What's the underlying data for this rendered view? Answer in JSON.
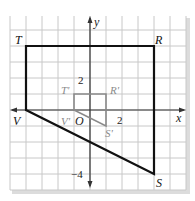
{
  "colors": {
    "background": "#ffffff",
    "grid_fill": "#ffffff",
    "grid_line": "#c8c8c8",
    "axis": "#333333",
    "preimage": "#111111",
    "image": "#8a8a8a",
    "shadow": "#dcdcdc"
  },
  "axes": {
    "x_label": "x",
    "y_label": "y",
    "origin_label": "O",
    "tick_labels": {
      "x_pos_2": "2",
      "y_pos_2": "2",
      "y_neg_4": "−4"
    }
  },
  "preimage": {
    "name": "TRSV",
    "vertices": [
      {
        "label": "T",
        "x": -4,
        "y": 4
      },
      {
        "label": "R",
        "x": 4,
        "y": 4
      },
      {
        "label": "S",
        "x": 4,
        "y": -4
      },
      {
        "label": "V",
        "x": -4,
        "y": 0
      }
    ]
  },
  "image": {
    "name": "T'R'S'V'",
    "vertices": [
      {
        "label": "T'",
        "x": -1,
        "y": 1
      },
      {
        "label": "R'",
        "x": 1,
        "y": 1
      },
      {
        "label": "S'",
        "x": 1,
        "y": -1
      },
      {
        "label": "V'",
        "x": -1,
        "y": 0
      }
    ]
  },
  "grid": {
    "x_min": -5,
    "x_max": 6,
    "y_min": -5,
    "y_max": 6,
    "unit": 1
  }
}
